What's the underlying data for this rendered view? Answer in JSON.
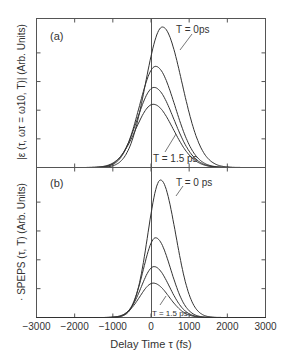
{
  "chart_data": [
    {
      "type": "line",
      "panel_label": "(a)",
      "title": "",
      "xlabel": "Delay Time τ (fs)",
      "ylabel": "|ε (τ, ωτ = ω10, T)| (Arb. Units)",
      "xlim": [
        -3000,
        3000
      ],
      "x_ticks": [
        -3000,
        -2000,
        -1000,
        0,
        1000,
        2000,
        3000
      ],
      "grid": false,
      "ylim": [
        0,
        1.05
      ],
      "annotations": [
        "T = 0ps",
        "T = 1.5 ps"
      ],
      "series": [
        {
          "name": "T = 0 ps",
          "peak_x": 300,
          "peak_y": 1.0,
          "width_left": 620,
          "width_right": 720
        },
        {
          "name": "T = 0.5 ps",
          "peak_x": 120,
          "peak_y": 0.72,
          "width_left": 600,
          "width_right": 720
        },
        {
          "name": "T = 1.0 ps",
          "peak_x": 80,
          "peak_y": 0.57,
          "width_left": 620,
          "width_right": 730
        },
        {
          "name": "T = 1.5 ps",
          "peak_x": 60,
          "peak_y": 0.45,
          "width_left": 650,
          "width_right": 740
        }
      ]
    },
    {
      "type": "line",
      "panel_label": "(b)",
      "title": "",
      "xlabel": "Delay Time τ (fs)",
      "ylabel": "· S_PEPS (τ, T) (Arb. Units)",
      "xlim": [
        -3000,
        3000
      ],
      "x_ticks": [
        -3000,
        -2000,
        -1000,
        0,
        1000,
        2000,
        3000
      ],
      "grid": false,
      "ylim": [
        0,
        1.05
      ],
      "annotations": [
        "T = 0 ps",
        "T = 1.5 ps"
      ],
      "series": [
        {
          "name": "T = 0 ps",
          "peak_x": 250,
          "peak_y": 1.0,
          "width_left": 470,
          "width_right": 560
        },
        {
          "name": "T = 0.5 ps",
          "peak_x": 120,
          "peak_y": 0.58,
          "width_left": 450,
          "width_right": 560
        },
        {
          "name": "T = 1.0 ps",
          "peak_x": 80,
          "peak_y": 0.37,
          "width_left": 470,
          "width_right": 570
        },
        {
          "name": "T = 1.5 ps",
          "peak_x": 60,
          "peak_y": 0.25,
          "width_left": 500,
          "width_right": 580
        }
      ]
    }
  ],
  "labels": {
    "panel_a": "(a)",
    "panel_b": "(b)",
    "a_top_annot": "T = 0ps",
    "a_bottom_annot": "T = 1.5 ps",
    "b_top_annot": "T = 0 ps",
    "b_bottom_annot": "T = 1.5 ps",
    "ylabel_a": "|ε (τ, ωτ = ω10, T)| (Arb. Units)",
    "ylabel_b": "· SPEPS (τ, T) (Arb. Units)",
    "xlabel": "Delay Time τ (fs)",
    "xticks": [
      "−3000",
      "−2000",
      "−1000",
      "0",
      "1000",
      "2000",
      "3000"
    ]
  }
}
